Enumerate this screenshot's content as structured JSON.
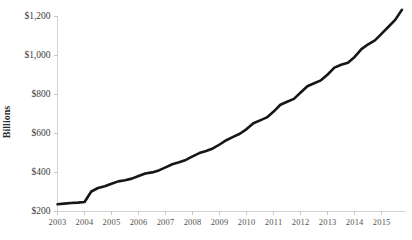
{
  "chart_data": {
    "type": "line",
    "title": "",
    "xlabel": "",
    "ylabel": "Billions",
    "ylim": [
      200,
      1200
    ],
    "xlim": [
      2003.0,
      2015.9
    ],
    "grid": false,
    "legend": false,
    "y_tick_labels": [
      "$200",
      "$400",
      "$600",
      "$800",
      "$1,000",
      "$1,200"
    ],
    "y_tick_values": [
      200,
      400,
      600,
      800,
      1000,
      1200
    ],
    "x_tick_labels": [
      "2003",
      "2004",
      "2005",
      "2006",
      "2007",
      "2008",
      "2009",
      "2010",
      "2011",
      "2012",
      "2013",
      "2014",
      "2015"
    ],
    "x_tick_values": [
      2003,
      2004,
      2005,
      2006,
      2007,
      2008,
      2009,
      2010,
      2011,
      2012,
      2013,
      2014,
      2015
    ],
    "series": [
      {
        "name": "Billions",
        "color": "#161616",
        "x": [
          2003.0,
          2003.25,
          2003.5,
          2003.75,
          2004.0,
          2004.25,
          2004.5,
          2004.75,
          2005.0,
          2005.25,
          2005.5,
          2005.75,
          2006.0,
          2006.25,
          2006.5,
          2006.75,
          2007.0,
          2007.25,
          2007.5,
          2007.75,
          2008.0,
          2008.25,
          2008.5,
          2008.75,
          2009.0,
          2009.25,
          2009.5,
          2009.75,
          2010.0,
          2010.25,
          2010.5,
          2010.75,
          2011.0,
          2011.25,
          2011.5,
          2011.75,
          2012.0,
          2012.25,
          2012.5,
          2012.75,
          2013.0,
          2013.25,
          2013.5,
          2013.75,
          2014.0,
          2014.25,
          2014.5,
          2014.75,
          2015.0,
          2015.25,
          2015.5,
          2015.75
        ],
        "values": [
          235,
          238,
          241,
          243,
          246,
          300,
          318,
          327,
          340,
          352,
          358,
          366,
          379,
          392,
          398,
          408,
          424,
          440,
          450,
          462,
          480,
          497,
          508,
          521,
          541,
          563,
          580,
          596,
          620,
          650,
          665,
          680,
          710,
          745,
          760,
          775,
          808,
          840,
          855,
          870,
          900,
          935,
          950,
          960,
          990,
          1030,
          1055,
          1075,
          1110,
          1145,
          1180,
          1232
        ]
      }
    ]
  },
  "axis": {
    "y_title": "Billions"
  }
}
